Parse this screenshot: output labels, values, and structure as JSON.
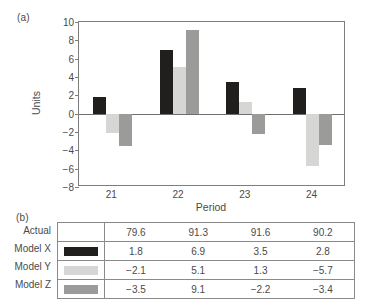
{
  "panels": {
    "a_label": "(a)",
    "b_label": "(b)"
  },
  "colors": {
    "model_x": "#211f1d",
    "model_y": "#d6d6d4",
    "model_z": "#9b9b99",
    "axis": "#7d7d7d",
    "text": "#4a4a4a"
  },
  "chart_data": {
    "type": "bar",
    "title": "",
    "xlabel": "Period",
    "ylabel": "Units",
    "categories": [
      "21",
      "22",
      "23",
      "24"
    ],
    "yticks": [
      10,
      8,
      6,
      4,
      2,
      0,
      -2,
      -4,
      -6,
      -8
    ],
    "ytick_labels": [
      "10",
      "8",
      "6",
      "4",
      "2",
      "0",
      "−2",
      "−4",
      "−6",
      "−8"
    ],
    "ylim": [
      -8,
      10
    ],
    "grid": false,
    "legend": "table-swatches",
    "series": [
      {
        "name": "Model X",
        "color": "#211f1d",
        "values": [
          1.8,
          6.9,
          3.5,
          2.8
        ]
      },
      {
        "name": "Model Y",
        "color": "#d6d6d4",
        "values": [
          -2.1,
          5.1,
          1.3,
          -5.7
        ]
      },
      {
        "name": "Model Z",
        "color": "#9b9b99",
        "values": [
          -3.5,
          9.1,
          -2.2,
          -3.4
        ]
      }
    ]
  },
  "table": {
    "rows": [
      {
        "label": "Actual",
        "has_swatch": false,
        "swatch_color": "",
        "values": [
          "79.6",
          "91.3",
          "91.6",
          "90.2"
        ]
      },
      {
        "label": "Model X",
        "has_swatch": true,
        "swatch_color": "#211f1d",
        "values": [
          "1.8",
          "6.9",
          "3.5",
          "2.8"
        ]
      },
      {
        "label": "Model Y",
        "has_swatch": true,
        "swatch_color": "#d6d6d4",
        "values": [
          "−2.1",
          "5.1",
          "1.3",
          "−5.7"
        ]
      },
      {
        "label": "Model Z",
        "has_swatch": true,
        "swatch_color": "#9b9b99",
        "values": [
          "−3.5",
          "9.1",
          "−2.2",
          "−3.4"
        ]
      }
    ]
  }
}
